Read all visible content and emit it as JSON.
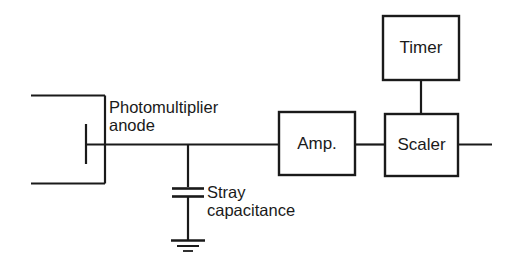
{
  "diagram": {
    "background_color": "#ffffff",
    "line_color": "#1a1a1a",
    "blocks": [
      {
        "id": "amp",
        "label": "Amp."
      },
      {
        "id": "scaler",
        "label": "Scaler"
      },
      {
        "id": "timer",
        "label": "Timer"
      }
    ],
    "annotations": {
      "pmt_anode_line1": "Photomultiplier",
      "pmt_anode_line2": "anode",
      "stray_cap_line1": "Stray",
      "stray_cap_line2": "capacitance"
    },
    "symbols": {
      "pmt_envelope": "photomultiplier-tube-outline",
      "anode": "anode-electrode-bar",
      "capacitor": "capacitor-symbol",
      "ground": "ground-symbol",
      "signal_wire": "signal-wire",
      "output_wire": "output-wire"
    }
  }
}
